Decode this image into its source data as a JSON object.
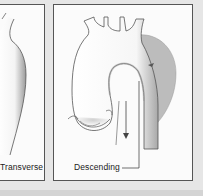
{
  "figure": {
    "panels": [
      {
        "id": "left",
        "label": "Transverse",
        "partially_visible": true
      },
      {
        "id": "right",
        "label": "Descending"
      }
    ]
  },
  "colors": {
    "background": "#e6e6e6",
    "panel_fill": "#fbfbfb",
    "border": "#555555",
    "aneurysm_shade": "#b8b8b8",
    "vessel_fill": "#ffffff",
    "vessel_outline": "#444444"
  }
}
